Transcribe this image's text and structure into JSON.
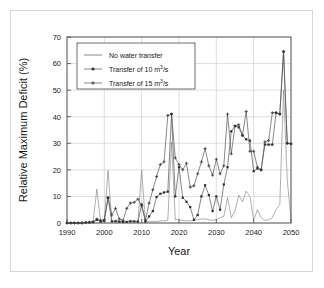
{
  "chart_data": {
    "type": "line",
    "title": "",
    "xlabel": "Year",
    "ylabel": "Relative Maximum Deficit (%)",
    "xlim": [
      1990,
      2050
    ],
    "ylim": [
      0,
      70
    ],
    "xticks": [
      1990,
      2000,
      2010,
      2020,
      2030,
      2040,
      2050
    ],
    "yticks": [
      0,
      10,
      20,
      30,
      40,
      50,
      60,
      70
    ],
    "grid": true,
    "legend_position": "top-left",
    "x": [
      1990,
      1991,
      1992,
      1993,
      1994,
      1995,
      1996,
      1997,
      1998,
      1999,
      2000,
      2001,
      2002,
      2003,
      2004,
      2005,
      2006,
      2007,
      2008,
      2009,
      2010,
      2011,
      2012,
      2013,
      2014,
      2015,
      2016,
      2017,
      2018,
      2019,
      2020,
      2021,
      2022,
      2023,
      2024,
      2025,
      2026,
      2027,
      2028,
      2029,
      2030,
      2031,
      2032,
      2033,
      2034,
      2035,
      2036,
      2037,
      2038,
      2039,
      2040,
      2041,
      2042,
      2043,
      2044,
      2045,
      2046,
      2047,
      2048,
      2049,
      2050
    ],
    "series": [
      {
        "name": "No water transfer",
        "marker": "none",
        "values": [
          0,
          0,
          0,
          0,
          0.3,
          0,
          0,
          0.5,
          12.8,
          0.5,
          1.0,
          19.8,
          0.5,
          1.2,
          0.6,
          0.4,
          0.5,
          1.0,
          0.6,
          0.5,
          19.9,
          0.4,
          0.5,
          0.6,
          0.5,
          0.8,
          0.8,
          1.0,
          30.5,
          1.2,
          1.2,
          1.0,
          0.8,
          0.8,
          1.0,
          1.3,
          1.5,
          1.5,
          1.2,
          1.0,
          1.2,
          2.0,
          2.5,
          9.6,
          2.0,
          4.5,
          10.5,
          8.0,
          12.0,
          10.0,
          1.0,
          5.0,
          2.0,
          1.0,
          1.2,
          2.0,
          5.0,
          7.0,
          50.0,
          16.0,
          1.5
        ]
      },
      {
        "name": "Transfer of 10 m3/s",
        "marker": "square",
        "values": [
          0,
          0,
          0,
          0,
          0,
          0.2,
          0.2,
          0.3,
          1.2,
          0.5,
          0.8,
          9.5,
          0.6,
          0.6,
          0.5,
          0.4,
          0.4,
          0.6,
          0.6,
          0.5,
          7.0,
          0.5,
          2.5,
          4.5,
          9.8,
          11.0,
          11.5,
          11.8,
          41.0,
          10.0,
          21.0,
          9.5,
          8.0,
          6.0,
          1.2,
          3.0,
          10.0,
          14.2,
          10.5,
          4.5,
          10.0,
          5.0,
          14.5,
          21.0,
          34.5,
          36.5,
          36.0,
          33.0,
          31.5,
          31.0,
          19.5,
          20.5,
          20.0,
          29.5,
          29.5,
          29.5,
          41.5,
          41.0,
          64.5,
          30.0,
          29.8
        ]
      },
      {
        "name": "Transfer of 15 m3/s",
        "marker": "plus",
        "values": [
          0,
          0,
          0,
          0,
          0,
          0.2,
          0.3,
          0.5,
          1.5,
          1.0,
          1.2,
          9.5,
          3.0,
          5.5,
          1.5,
          1.0,
          5.5,
          7.5,
          7.8,
          9.0,
          6.5,
          1.0,
          7.5,
          12.5,
          17.5,
          22.0,
          23.0,
          40.5,
          41.0,
          24.5,
          22.0,
          20.0,
          22.5,
          13.5,
          14.0,
          18.5,
          23.0,
          28.0,
          21.5,
          18.0,
          24.0,
          18.5,
          21.5,
          41.0,
          26.0,
          36.5,
          37.0,
          33.0,
          42.0,
          27.0,
          27.0,
          21.0,
          20.0,
          30.5,
          31.0,
          41.5,
          41.5,
          41.0,
          64.5,
          30.0,
          29.8
        ]
      }
    ]
  },
  "legend": {
    "items": [
      {
        "label_prefix": "No water transfer",
        "label_sup": "",
        "label_suffix": "",
        "marker": "line"
      },
      {
        "label_prefix": "Transfer of 10 m",
        "label_sup": "3",
        "label_suffix": "/s",
        "marker": "square"
      },
      {
        "label_prefix": "Transfer of 15 m",
        "label_sup": "3",
        "label_suffix": "/s",
        "marker": "plus"
      }
    ]
  },
  "axes": {
    "x_title": "Year",
    "y_title": "Relative Maximum Deficit (%)",
    "x_tick_labels": [
      "1990",
      "2000",
      "2010",
      "2020",
      "2030",
      "2040",
      "2050"
    ],
    "y_tick_labels": [
      "0",
      "10",
      "20",
      "30",
      "40",
      "50",
      "60",
      "70"
    ]
  },
  "colors": {
    "line": "#555555",
    "line_light": "#7a7a7a",
    "grid": "#c9c9c9",
    "frame": "#4a4a4a",
    "text": "#1a1a1a",
    "background": "#ffffff"
  }
}
